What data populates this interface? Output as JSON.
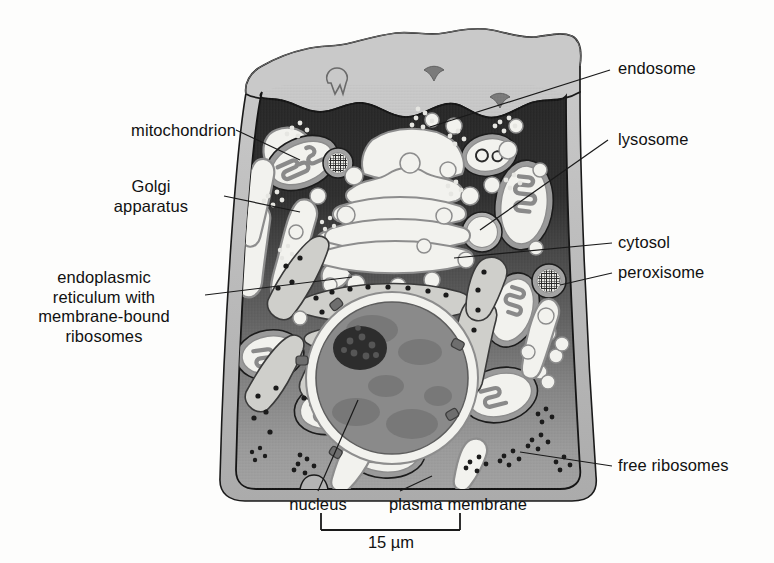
{
  "figure": {
    "kind": "animal-cell-cutaway-diagram",
    "scale_bar": {
      "label": "15 µm",
      "length_px": 139
    }
  },
  "labels": {
    "mitochondrion": {
      "text": "mitochondrion",
      "side": "left"
    },
    "golgi": {
      "text": "Golgi\napparatus",
      "side": "left"
    },
    "er": {
      "text": "endoplasmic\nreticulum with\nmembrane-bound\nribosomes",
      "side": "left"
    },
    "endosome": {
      "text": "endosome",
      "side": "right"
    },
    "lysosome": {
      "text": "lysosome",
      "side": "right"
    },
    "cytosol": {
      "text": "cytosol",
      "side": "right"
    },
    "peroxisome": {
      "text": "peroxisome",
      "side": "right"
    },
    "free_ribosomes": {
      "text": "free ribosomes",
      "side": "right"
    },
    "nucleus": {
      "text": "nucleus",
      "side": "bottom"
    },
    "plasma_membrane": {
      "text": "plasma membrane",
      "side": "bottom"
    }
  },
  "colors": {
    "surface_top": "#c9c9c9",
    "cytoplasm_dark": "#2a2a2a",
    "cytoplasm_mid": "#565656",
    "cytoplasm_light": "#9b9b9b",
    "halo": "#b4b4b4",
    "organelle_fill": "#f2f2ee",
    "organelle_rim": "#8d8d8d",
    "nucleoplasm": "#8a8a8a",
    "nucleolus": "#2d2d2d",
    "outline": "#1a1a1a",
    "leader": "#1a1a1a"
  }
}
